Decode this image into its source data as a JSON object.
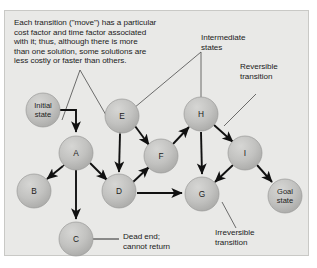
{
  "figure": {
    "background": "#ffffff",
    "panel_color": "#e9e9e7",
    "node_fill": "#bdbdbb",
    "node_stroke": "#9a9a98",
    "arrow_color": "#111111",
    "leader_color": "#4a4a4a",
    "text_color": "#1b1b1b"
  },
  "caption": {
    "text": "Each transition (\"move\") has a particular\ncost factor and time factor associated\nwith it; thus, although there is more\nthan one solution, some solutions are\nless costly or faster than others."
  },
  "labels": {
    "initial_state": "Initial\nstate",
    "goal_state": "Goal\nstate",
    "intermediate_states": "Intermediate\nstates",
    "reversible_transition": "Reversible\ntransition",
    "irreversible_transition": "Irreversible\ntransition",
    "dead_end": "Dead end;\ncannot return"
  },
  "nodes": [
    {
      "id": "initial",
      "label": "Initial\nstate",
      "x": 43,
      "y": 110,
      "r": 17,
      "two_line": true
    },
    {
      "id": "A",
      "label": "A",
      "x": 76,
      "y": 153,
      "r": 17,
      "two_line": false
    },
    {
      "id": "B",
      "label": "B",
      "x": 34,
      "y": 191,
      "r": 17,
      "two_line": false
    },
    {
      "id": "C",
      "label": "C",
      "x": 76,
      "y": 239,
      "r": 17,
      "two_line": false
    },
    {
      "id": "D",
      "label": "D",
      "x": 119,
      "y": 191,
      "r": 17,
      "two_line": false
    },
    {
      "id": "E",
      "label": "E",
      "x": 122,
      "y": 116,
      "r": 17,
      "two_line": false
    },
    {
      "id": "F",
      "label": "F",
      "x": 161,
      "y": 156,
      "r": 17,
      "two_line": false
    },
    {
      "id": "G",
      "label": "G",
      "x": 202,
      "y": 194,
      "r": 17,
      "two_line": false
    },
    {
      "id": "H",
      "label": "H",
      "x": 201,
      "y": 114,
      "r": 17,
      "two_line": false
    },
    {
      "id": "I",
      "label": "I",
      "x": 245,
      "y": 153,
      "r": 17,
      "two_line": false
    },
    {
      "id": "goal",
      "label": "Goal\nstate",
      "x": 285,
      "y": 196,
      "r": 17,
      "two_line": true
    }
  ],
  "edges": [
    {
      "from": "initial",
      "to": "A",
      "kind": "elbow-down",
      "arrows": "one"
    },
    {
      "from": "A",
      "to": "B",
      "kind": "straight",
      "arrows": "both"
    },
    {
      "from": "A",
      "to": "C",
      "kind": "straight",
      "arrows": "one"
    },
    {
      "from": "A",
      "to": "D",
      "kind": "straight",
      "arrows": "one"
    },
    {
      "from": "E",
      "to": "D",
      "kind": "straight",
      "arrows": "both"
    },
    {
      "from": "E",
      "to": "F",
      "kind": "straight",
      "arrows": "both"
    },
    {
      "from": "D",
      "to": "F",
      "kind": "straight",
      "arrows": "one"
    },
    {
      "from": "D",
      "to": "G",
      "kind": "straight",
      "arrows": "one"
    },
    {
      "from": "F",
      "to": "H",
      "kind": "straight",
      "arrows": "one"
    },
    {
      "from": "H",
      "to": "G",
      "kind": "straight",
      "arrows": "one"
    },
    {
      "from": "H",
      "to": "I",
      "kind": "straight",
      "arrows": "both"
    },
    {
      "from": "I",
      "to": "G",
      "kind": "straight",
      "arrows": "one"
    },
    {
      "from": "I",
      "to": "goal",
      "kind": "straight",
      "arrows": "one"
    }
  ],
  "annotations": [
    {
      "id": "caption-leader-left",
      "target": "E-area"
    },
    {
      "id": "caption-leader-right",
      "target": "A-area"
    },
    {
      "id": "intermediate-leader-e",
      "target": "E"
    },
    {
      "id": "intermediate-leader-h",
      "target": "H"
    },
    {
      "id": "reversible-leader",
      "target": "H-I-edge"
    },
    {
      "id": "irreversible-leader",
      "target": "I-G-edge"
    },
    {
      "id": "deadend-leader",
      "target": "C"
    }
  ]
}
